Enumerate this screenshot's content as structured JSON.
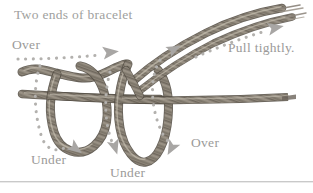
{
  "figure": {
    "title_label": "Two ends of bracelet",
    "background_color": "#ffffff",
    "label_color": "#9b9a99",
    "cord_color": "#8a8278",
    "arrow_color": "#a8a6a4",
    "dot_color": "#b3b1ae",
    "divider_color": "#c9c9c9",
    "width": 313,
    "height": 193
  },
  "labels": {
    "over_left": "Over",
    "pull_tightly": "Pull tightly.",
    "under_left": "Under",
    "under_center": "Under",
    "over_right": "Over"
  },
  "diagram": {
    "cord_count": 2,
    "loop_count": 2,
    "arrow_count": 5,
    "arrow_directions": [
      "right",
      "down",
      "down",
      "up-right",
      "down-left"
    ]
  }
}
